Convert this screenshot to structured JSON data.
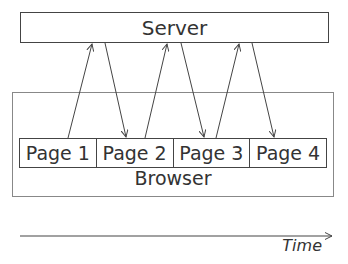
{
  "server": {
    "label": "Server"
  },
  "browser": {
    "label": "Browser",
    "pages": [
      {
        "label": "Page 1"
      },
      {
        "label": "Page 2"
      },
      {
        "label": "Page 3"
      },
      {
        "label": "Page 4"
      }
    ]
  },
  "timeline": {
    "label": "Time"
  },
  "arrows": [
    {
      "from": "Page 1",
      "to": "Server",
      "direction": "request"
    },
    {
      "from": "Server",
      "to": "Page 2",
      "direction": "response"
    },
    {
      "from": "Page 2",
      "to": "Server",
      "direction": "request"
    },
    {
      "from": "Server",
      "to": "Page 3",
      "direction": "response"
    },
    {
      "from": "Page 3",
      "to": "Server",
      "direction": "request"
    },
    {
      "from": "Server",
      "to": "Page 4",
      "direction": "response"
    }
  ],
  "colors": {
    "stroke": "#444444",
    "text": "#333333",
    "browser_border": "#888888"
  }
}
